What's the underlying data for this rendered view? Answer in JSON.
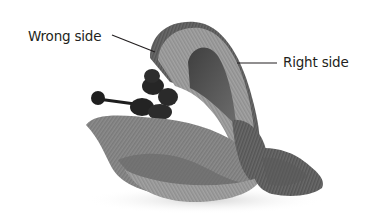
{
  "image": {
    "subject": "fabric ribbon flower with stamens",
    "width": 374,
    "height": 223,
    "palette": {
      "background": "#ffffff",
      "fabric_light": "#9a9a9a",
      "fabric_mid": "#7a7a7a",
      "fabric_dark": "#4a4a4a",
      "stamen": "#222222",
      "label_text": "#231f20",
      "leader_line": "#231f20"
    }
  },
  "callouts": [
    {
      "label": "Wrong side",
      "points_to": "outer edge of upper back petal"
    },
    {
      "label": "Right side",
      "points_to": "face of upper back petal"
    }
  ]
}
